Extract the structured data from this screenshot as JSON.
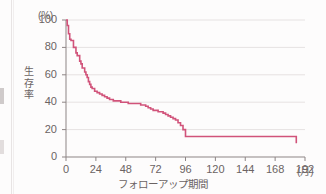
{
  "chart_data": {
    "type": "line",
    "title": "",
    "subtitle": "",
    "xlabel": "フォローアップ期間",
    "ylabel": "生存率",
    "x_unit": "(月)",
    "y_unit": "(%)",
    "xlim": [
      0,
      192
    ],
    "ylim": [
      0,
      100
    ],
    "grid": "horizontal",
    "legend": "none",
    "step_style": "kaplan-meier",
    "line_color": "#d1537a",
    "xticks": [
      0,
      24,
      48,
      72,
      96,
      120,
      144,
      168,
      192
    ],
    "xtick_labels": [
      "0",
      "24",
      "48",
      "72",
      "96",
      "120",
      "144",
      "168",
      "192"
    ],
    "yticks": [
      0,
      20,
      40,
      60,
      80,
      100
    ],
    "ytick_labels": [
      "0",
      "20",
      "40",
      "60",
      "80",
      "100"
    ],
    "series": [
      {
        "name": "生存率",
        "x": [
          0,
          1,
          2,
          3,
          4,
          6,
          8,
          9,
          11,
          12,
          13,
          15,
          16,
          17,
          18,
          19,
          20,
          21,
          23,
          25,
          27,
          29,
          31,
          33,
          35,
          38,
          41,
          44,
          47,
          50,
          54,
          58,
          60,
          62,
          64,
          66,
          68,
          70,
          72,
          74,
          76,
          78,
          80,
          82,
          84,
          86,
          88,
          90,
          92,
          94,
          96,
          156,
          185
        ],
        "y": [
          100,
          96,
          90,
          86,
          85,
          80,
          76,
          74,
          70,
          68,
          65,
          62,
          60,
          58,
          55,
          53,
          51,
          50,
          48,
          47,
          46,
          45,
          44,
          43,
          42,
          41,
          41,
          40,
          40,
          39,
          39,
          39,
          38,
          38,
          37,
          36,
          35,
          34,
          34,
          33,
          33,
          32,
          31,
          30,
          29,
          28,
          27,
          25,
          23,
          20,
          15,
          15,
          10
        ]
      }
    ],
    "annotations": [
      {
        "text": "初期に急峻な低下",
        "x": 12,
        "y": 68
      },
      {
        "text": "96ヵ月以降プラトー",
        "x": 96,
        "y": 15
      }
    ],
    "key_values": {
      "start_survival": 100,
      "survival_at_24": 47,
      "survival_at_48": 40,
      "survival_at_72": 34,
      "survival_at_96": 15,
      "plateau_survival": 15,
      "final_survival": 10,
      "last_followup_month": 185
    }
  },
  "axis": {
    "y_unit_label": "(%)",
    "x_unit_label": "(月)",
    "y_title": "生存率",
    "x_title": "フォローアップ期間"
  }
}
